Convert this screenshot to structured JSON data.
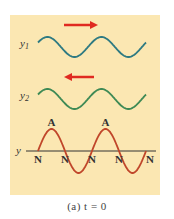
{
  "diagram": {
    "wave1": {
      "label": "y",
      "subscript": "1",
      "direction": "right",
      "color": "#2e7a82"
    },
    "wave2": {
      "label": "y",
      "subscript": "2",
      "direction": "left",
      "color": "#3e8a55"
    },
    "resultant": {
      "axis_label": "y",
      "color": "#c0462a",
      "antinode_label": "A",
      "node_label": "N",
      "antinode_count": 2,
      "node_count": 5
    },
    "arrow_color": "#e02a20",
    "panel_color": "#fbe7b2"
  },
  "caption": "(a)  t = 0"
}
